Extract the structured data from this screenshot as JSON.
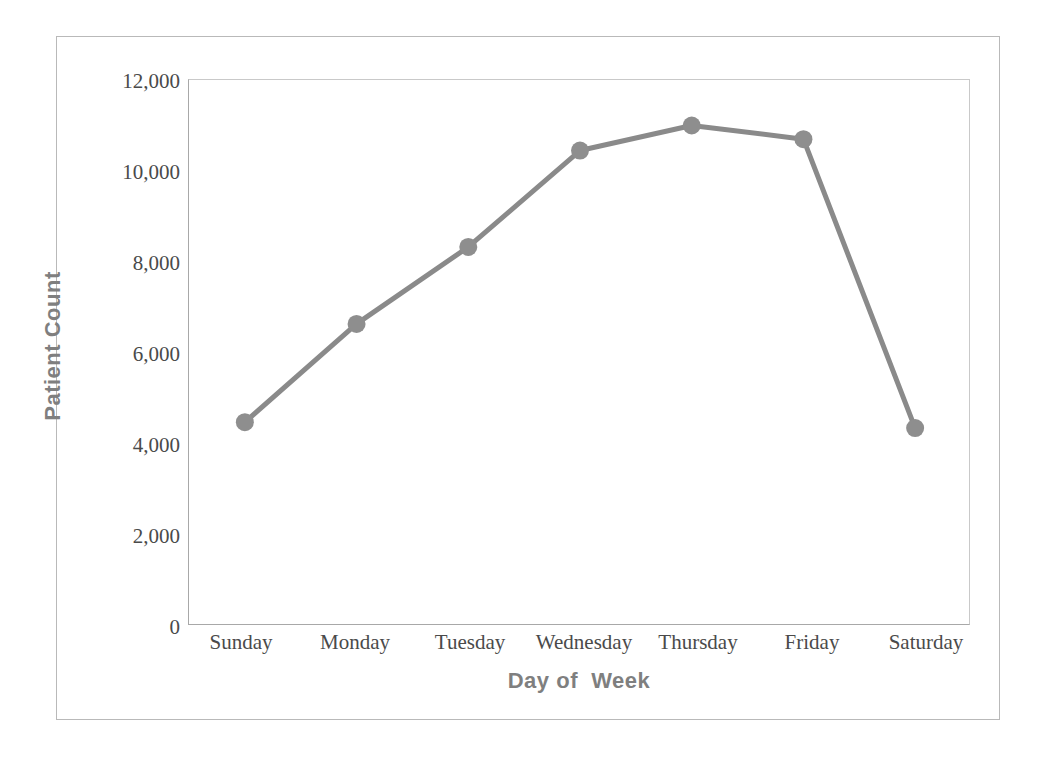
{
  "chart_data": {
    "type": "line",
    "title": "",
    "subtitle": "",
    "xlabel": "Day of  Week",
    "ylabel": "Patient Count",
    "categories": [
      "Sunday",
      "Monday",
      "Tuesday",
      "Wednesday",
      "Thursday",
      "Friday",
      "Saturday"
    ],
    "values": [
      4480,
      6640,
      8330,
      10450,
      11000,
      10700,
      4350
    ],
    "series": [
      {
        "name": "Patient Count",
        "values": [
          4480,
          6640,
          8330,
          10450,
          11000,
          10700,
          4350
        ]
      }
    ],
    "ylim": [
      0,
      12000
    ],
    "yticks": [
      0,
      2000,
      4000,
      6000,
      8000,
      10000,
      12000
    ],
    "ytick_labels": [
      "0",
      "2,000",
      "4,000",
      "6,000",
      "8,000",
      "10,000",
      "12,000"
    ],
    "grid": false,
    "legend": false,
    "legend_position": "none",
    "marker": "circle",
    "colors": {
      "series_line": "#8a8a8a",
      "marker_fill": "#8e8e8e",
      "axis": "#a8a8a8",
      "axis_title_text": "#7f7f7f",
      "tick_text": "#4a4a4a",
      "frame": "#b9b9b9",
      "background": "#ffffff"
    }
  }
}
